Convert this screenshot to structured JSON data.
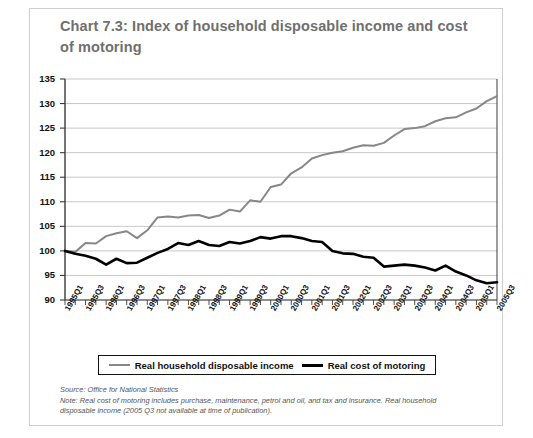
{
  "title": "Chart 7.3: Index of household disposable income and cost of motoring",
  "legend": {
    "series1_label": "Real household disposable income",
    "series2_label": "Real cost of motoring",
    "series1_color": "#878787",
    "series2_color": "#000000"
  },
  "notes": {
    "source": "Source: Office for National Statistics",
    "note": "Note: Real cost of motoring includes purchase, maintenance, petrol and oil, and tax and insurance. Real household disposable income (2005 Q3 not available at time of publication)."
  },
  "chart_data": {
    "type": "line",
    "title": "Chart 7.3: Index of household disposable income and cost of motoring",
    "xlabel": "",
    "ylabel": "",
    "ylim": [
      90,
      135
    ],
    "yticks": [
      90,
      95,
      100,
      105,
      110,
      115,
      120,
      125,
      130,
      135
    ],
    "grid": true,
    "legend_position": "bottom",
    "x": [
      "1995Q1",
      "1995Q2",
      "1995Q3",
      "1995Q4",
      "1996Q1",
      "1996Q2",
      "1996Q3",
      "1996Q4",
      "1997Q1",
      "1997Q2",
      "1997Q3",
      "1997Q4",
      "1998Q1",
      "1998Q2",
      "1998Q3",
      "1998Q4",
      "1999Q1",
      "1999Q2",
      "1999Q3",
      "1999Q4",
      "2000Q1",
      "2000Q2",
      "2000Q3",
      "2000Q4",
      "2001Q1",
      "2001Q2",
      "2001Q3",
      "2001Q4",
      "2002Q1",
      "2002Q2",
      "2002Q3",
      "2002Q4",
      "2003Q1",
      "2003Q2",
      "2003Q3",
      "2003Q4",
      "2004Q1",
      "2004Q2",
      "2004Q3",
      "2004Q4",
      "2005Q1",
      "2005Q2",
      "2005Q3"
    ],
    "xtick_labels": [
      "1995Q1",
      "1995Q3",
      "1996Q1",
      "1996Q3",
      "1997Q1",
      "1997Q3",
      "1998Q1",
      "1998Q3",
      "1999Q1",
      "1999Q3",
      "2000Q1",
      "2000Q3",
      "2001Q1",
      "2001Q3",
      "2002Q1",
      "2002Q3",
      "2003Q1",
      "2003Q3",
      "2004Q1",
      "2004Q3",
      "2005Q1",
      "2005Q3"
    ],
    "series": [
      {
        "name": "Real household disposable income",
        "color": "#878787",
        "values": [
          100.0,
          99.8,
          101.6,
          101.5,
          103.0,
          103.6,
          104.0,
          102.6,
          104.2,
          106.8,
          107.0,
          106.8,
          107.2,
          107.3,
          106.7,
          107.2,
          108.4,
          108.0,
          110.3,
          110.0,
          113.0,
          113.5,
          115.8,
          117.0,
          118.8,
          119.5,
          120.0,
          120.3,
          121.0,
          121.5,
          121.4,
          122.0,
          123.5,
          124.8,
          125.0,
          125.4,
          126.4,
          127.0,
          127.2,
          128.2,
          129.0,
          130.5,
          131.5
        ]
      },
      {
        "name": "Real cost of motoring",
        "color": "#000000",
        "values": [
          100.0,
          99.4,
          99.0,
          98.4,
          97.2,
          98.4,
          97.5,
          97.6,
          98.6,
          99.6,
          100.4,
          101.6,
          101.2,
          102.0,
          101.2,
          101.0,
          101.8,
          101.5,
          102.0,
          102.8,
          102.5,
          103.0,
          103.0,
          102.6,
          102.0,
          101.8,
          100.0,
          99.5,
          99.4,
          98.8,
          98.6,
          96.8,
          97.0,
          97.2,
          97.0,
          96.6,
          96.0,
          97.0,
          95.8,
          95.0,
          94.0,
          93.4,
          93.6
        ]
      }
    ]
  }
}
